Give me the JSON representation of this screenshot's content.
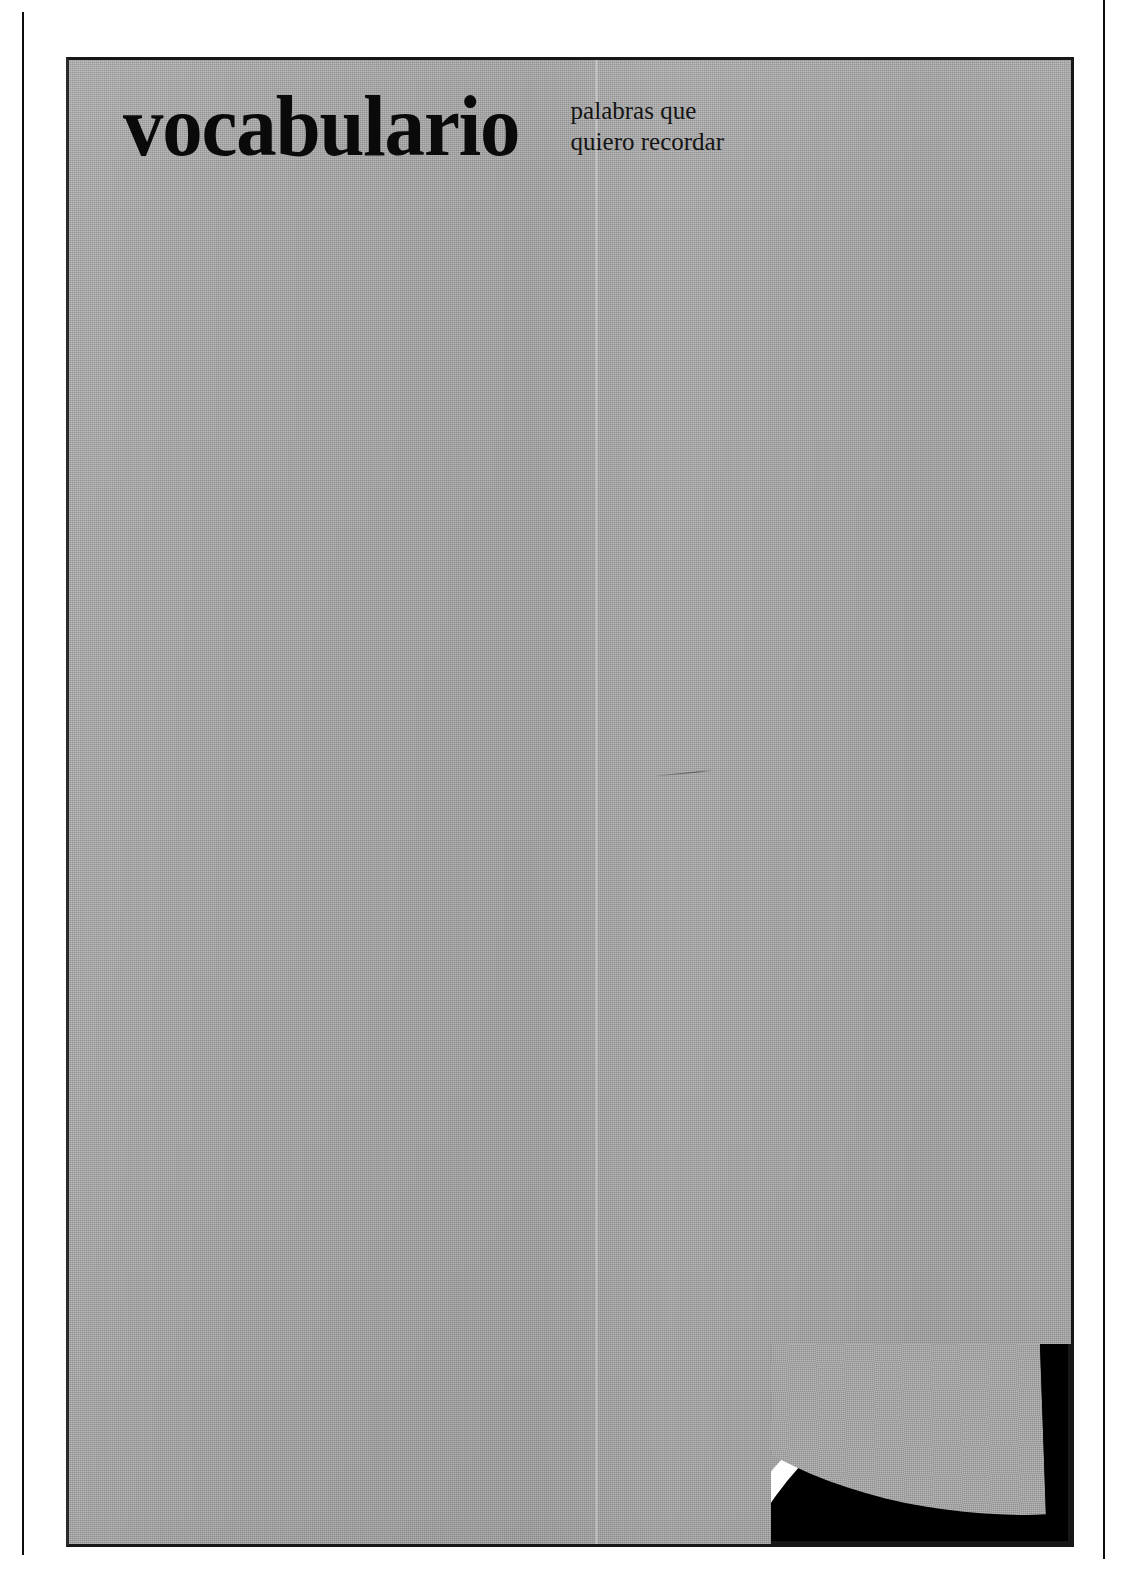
{
  "page": {
    "kind": "scanned-book-page",
    "background_color": "#ffffff",
    "panel_color": "#a9a9a9",
    "ink_color": "#0a0a0a"
  },
  "masthead": {
    "title": "vocabulario",
    "subtitle_line_1": "palabras que",
    "subtitle_line_2": "quiero recordar"
  },
  "artifacts": {
    "crease_label": "vertical-scan-crease",
    "scratch_label": "hairline-scratch",
    "curl_label": "page-curl-corner",
    "rule_left_label": "left-margin-rule",
    "rule_right_label": "right-margin-rule"
  }
}
